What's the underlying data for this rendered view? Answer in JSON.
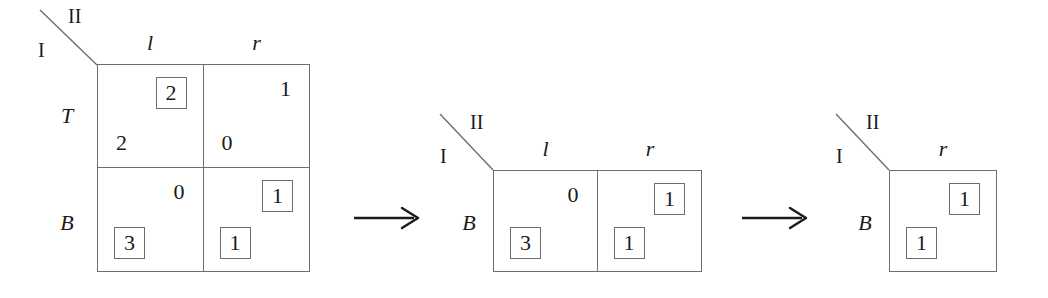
{
  "figure": {
    "background_color": "#ffffff",
    "line_color": "#6e6e6e",
    "text_color": "#1a1a1a"
  },
  "players": {
    "row_player": "I",
    "column_player": "II"
  },
  "arrows": {
    "glyph": "→",
    "first_label": "→",
    "second_label": "→"
  },
  "stages": [
    {
      "name": "stage-1-full-game",
      "columns": [
        "l",
        "r"
      ],
      "rows": [
        "T",
        "B"
      ],
      "cells": [
        {
          "row": "T",
          "column": "l",
          "column_payoff": "2",
          "column_payoff_boxed": true,
          "row_payoff": "2",
          "row_payoff_boxed": false
        },
        {
          "row": "T",
          "column": "r",
          "column_payoff": "1",
          "column_payoff_boxed": false,
          "row_payoff": "0",
          "row_payoff_boxed": false
        },
        {
          "row": "B",
          "column": "l",
          "column_payoff": "0",
          "column_payoff_boxed": false,
          "row_payoff": "3",
          "row_payoff_boxed": true
        },
        {
          "row": "B",
          "column": "r",
          "column_payoff": "1",
          "column_payoff_boxed": true,
          "row_payoff": "1",
          "row_payoff_boxed": true
        }
      ]
    },
    {
      "name": "stage-2-after-eliminating-T",
      "columns": [
        "l",
        "r"
      ],
      "rows": [
        "B"
      ],
      "cells": [
        {
          "row": "B",
          "column": "l",
          "column_payoff": "0",
          "column_payoff_boxed": false,
          "row_payoff": "3",
          "row_payoff_boxed": true
        },
        {
          "row": "B",
          "column": "r",
          "column_payoff": "1",
          "column_payoff_boxed": true,
          "row_payoff": "1",
          "row_payoff_boxed": true
        }
      ]
    },
    {
      "name": "stage-3-after-eliminating-l",
      "columns": [
        "r"
      ],
      "rows": [
        "B"
      ],
      "cells": [
        {
          "row": "B",
          "column": "r",
          "column_payoff": "1",
          "column_payoff_boxed": true,
          "row_payoff": "1",
          "row_payoff_boxed": true
        }
      ]
    }
  ]
}
